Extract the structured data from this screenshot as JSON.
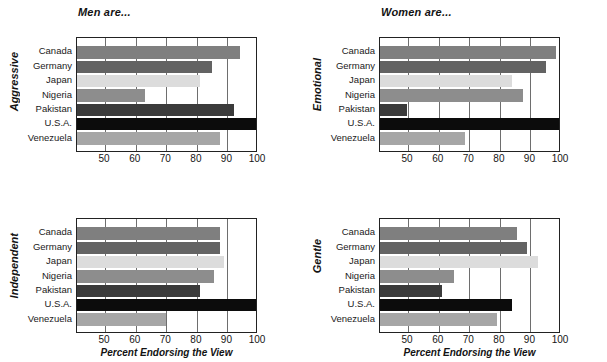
{
  "figure": {
    "axis_title": "Percent Endorsing the View",
    "categories": [
      "Canada",
      "Germany",
      "Japan",
      "Nigeria",
      "Pakistan",
      "U.S.A.",
      "Venezuela"
    ],
    "xticks": [
      50,
      60,
      70,
      80,
      90,
      100
    ],
    "xmin": 40.8,
    "xmax": 100,
    "series_colors": [
      "#7f7f7f",
      "#636363",
      "#dcdcdc",
      "#8d8d8d",
      "#3b3b3b",
      "#0c0c0c",
      "#a6a6a6"
    ]
  },
  "chart_data": [
    {
      "type": "bar",
      "panel": "top-left",
      "title": "Men are...",
      "ylabel": "Aggressive",
      "xlabel": "",
      "categories": [
        "Canada",
        "Germany",
        "Japan",
        "Nigeria",
        "Pakistan",
        "U.S.A.",
        "Venezuela"
      ],
      "values": [
        94,
        85,
        81,
        63,
        92,
        100,
        87.5
      ],
      "xlim": [
        40.8,
        100
      ],
      "xticks": [
        50,
        60,
        70,
        80,
        90,
        100
      ],
      "grid": true,
      "legend": "none",
      "orientation": "horizontal"
    },
    {
      "type": "bar",
      "panel": "top-right",
      "title": "Women are...",
      "ylabel": "Emotional",
      "xlabel": "",
      "categories": [
        "Canada",
        "Germany",
        "Japan",
        "Nigeria",
        "Pakistan",
        "U.S.A.",
        "Venezuela"
      ],
      "values": [
        98.5,
        95,
        84,
        87.5,
        49.5,
        99.5,
        68.5
      ],
      "xlim": [
        40.8,
        100
      ],
      "xticks": [
        50,
        60,
        70,
        80,
        90,
        100
      ],
      "grid": true,
      "legend": "none",
      "orientation": "horizontal"
    },
    {
      "type": "bar",
      "panel": "bottom-left",
      "title": "",
      "ylabel": "Independent",
      "xlabel": "Percent Endorsing the View",
      "categories": [
        "Canada",
        "Germany",
        "Japan",
        "Nigeria",
        "Pakistan",
        "U.S.A.",
        "Venezuela"
      ],
      "values": [
        87.5,
        87.5,
        89,
        85.5,
        81,
        100,
        70
      ],
      "xlim": [
        40.8,
        100
      ],
      "xticks": [
        50,
        60,
        70,
        80,
        90,
        100
      ],
      "grid": true,
      "legend": "none",
      "orientation": "horizontal"
    },
    {
      "type": "bar",
      "panel": "bottom-right",
      "title": "",
      "ylabel": "Gentle",
      "xlabel": "Percent Endorsing the View",
      "categories": [
        "Canada",
        "Germany",
        "Japan",
        "Nigeria",
        "Pakistan",
        "U.S.A.",
        "Venezuela"
      ],
      "values": [
        85.5,
        89,
        92.5,
        65,
        61,
        84,
        79
      ],
      "xlim": [
        40.8,
        100
      ],
      "xticks": [
        50,
        60,
        70,
        80,
        90,
        100
      ],
      "grid": true,
      "legend": "none",
      "orientation": "horizontal"
    }
  ]
}
